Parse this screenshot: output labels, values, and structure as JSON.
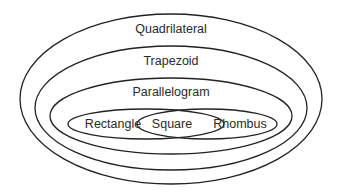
{
  "diagram": {
    "type": "nested-venn",
    "title": "",
    "stroke_color": "#222222",
    "background": "#ffffff",
    "sets": [
      {
        "id": "quadrilateral",
        "label": "Quadrilateral",
        "parent": null
      },
      {
        "id": "trapezoid",
        "label": "Trapezoid",
        "parent": "quadrilateral"
      },
      {
        "id": "parallelogram",
        "label": "Parallelogram",
        "parent": "trapezoid"
      },
      {
        "id": "rectangle",
        "label": "Rectangle",
        "parent": "parallelogram"
      },
      {
        "id": "rhombus",
        "label": "Rhombus",
        "parent": "parallelogram"
      }
    ],
    "intersections": [
      {
        "id": "square",
        "label": "Square",
        "of": [
          "rectangle",
          "rhombus"
        ]
      }
    ]
  }
}
